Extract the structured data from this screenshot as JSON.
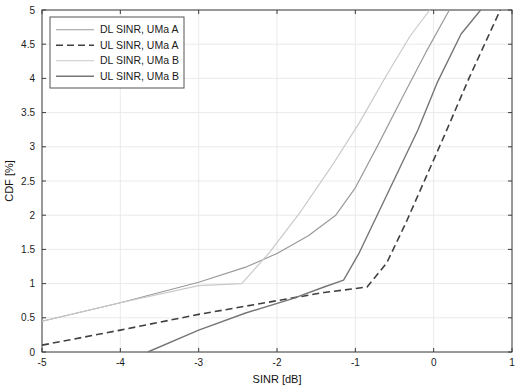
{
  "figure": {
    "background_color": "#ffffff",
    "axes_color": "#3c3c3c",
    "grid_color": "#e8e8e8"
  },
  "legend": {
    "position": "top-left",
    "border_color": "#555555",
    "background": "#ffffff",
    "entries": [
      {
        "label": "DL SINR, UMa A",
        "style": "solid",
        "color": "#9a9a9a",
        "width": 1.2
      },
      {
        "label": "UL SINR,  UMa A",
        "style": "dashed",
        "color": "#404040",
        "width": 1.6
      },
      {
        "label": "DL SINR, UMa B",
        "style": "solid",
        "color": "#c9c9c9",
        "width": 1.2
      },
      {
        "label": "UL SINR,  UMa B",
        "style": "solid",
        "color": "#767676",
        "width": 1.4
      }
    ]
  },
  "chart_data": {
    "type": "line",
    "title": "",
    "xlabel": "SINR [dB]",
    "ylabel": "CDF [%]",
    "xlim": [
      -5,
      1
    ],
    "ylim": [
      0,
      5
    ],
    "xticks": [
      -5,
      -4,
      -3,
      -2,
      -1,
      0,
      1
    ],
    "xtick_labels": [
      "-5",
      "-4",
      "-3",
      "-2",
      "-1",
      "0",
      "1"
    ],
    "yticks": [
      0,
      0.5,
      1,
      1.5,
      2,
      2.5,
      3,
      3.5,
      4,
      4.5,
      5
    ],
    "ytick_labels": [
      "0",
      "0.5",
      "1",
      "1.5",
      "2",
      "2.5",
      "3",
      "3.5",
      "4",
      "4.5",
      "5"
    ],
    "grid": true,
    "legend_position": "upper left",
    "series": [
      {
        "name": "DL SINR, UMa A",
        "style": "solid",
        "color": "#9a9a9a",
        "width": 1.2,
        "points": [
          [
            -5.0,
            0.45
          ],
          [
            -4.0,
            0.72
          ],
          [
            -3.0,
            1.02
          ],
          [
            -2.4,
            1.24
          ],
          [
            -2.0,
            1.44
          ],
          [
            -1.6,
            1.7
          ],
          [
            -1.25,
            2.0
          ],
          [
            -1.0,
            2.4
          ],
          [
            -0.7,
            3.05
          ],
          [
            -0.4,
            3.72
          ],
          [
            -0.1,
            4.38
          ],
          [
            0.2,
            5.0
          ]
        ]
      },
      {
        "name": "UL SINR,  UMa A",
        "style": "dashed",
        "color": "#404040",
        "width": 1.6,
        "points": [
          [
            -5.0,
            0.1
          ],
          [
            -4.0,
            0.32
          ],
          [
            -3.0,
            0.55
          ],
          [
            -2.0,
            0.75
          ],
          [
            -1.4,
            0.87
          ],
          [
            -0.85,
            0.95
          ],
          [
            -0.6,
            1.3
          ],
          [
            -0.35,
            1.9
          ],
          [
            -0.1,
            2.55
          ],
          [
            0.15,
            3.2
          ],
          [
            0.45,
            4.0
          ],
          [
            0.85,
            5.0
          ]
        ]
      },
      {
        "name": "DL SINR, UMa B",
        "style": "solid",
        "color": "#c9c9c9",
        "width": 1.2,
        "points": [
          [
            -5.0,
            0.45
          ],
          [
            -4.0,
            0.72
          ],
          [
            -3.0,
            0.97
          ],
          [
            -2.45,
            1.0
          ],
          [
            -2.1,
            1.45
          ],
          [
            -1.7,
            2.05
          ],
          [
            -1.3,
            2.72
          ],
          [
            -0.95,
            3.35
          ],
          [
            -0.6,
            4.05
          ],
          [
            -0.3,
            4.62
          ],
          [
            -0.05,
            5.0
          ]
        ]
      },
      {
        "name": "UL SINR,  UMa B",
        "style": "solid",
        "color": "#767676",
        "width": 1.4,
        "points": [
          [
            -3.65,
            0.0
          ],
          [
            -3.0,
            0.32
          ],
          [
            -2.4,
            0.57
          ],
          [
            -1.8,
            0.78
          ],
          [
            -1.4,
            0.95
          ],
          [
            -1.15,
            1.05
          ],
          [
            -0.95,
            1.45
          ],
          [
            -0.7,
            2.05
          ],
          [
            -0.45,
            2.65
          ],
          [
            -0.2,
            3.25
          ],
          [
            0.05,
            3.95
          ],
          [
            0.35,
            4.65
          ],
          [
            0.6,
            5.0
          ]
        ]
      }
    ]
  }
}
